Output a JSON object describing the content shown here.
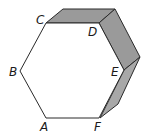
{
  "figure": {
    "colors": {
      "background": "#ffffff",
      "edge": "#2a2a2a",
      "front_face": "#ffffff",
      "side_face": "#9a9a9a"
    },
    "vertices": {
      "A": {
        "label": "A"
      },
      "B": {
        "label": "B"
      },
      "C": {
        "label": "C"
      },
      "D": {
        "label": "D"
      },
      "E": {
        "label": "E"
      },
      "F": {
        "label": "F"
      }
    }
  }
}
